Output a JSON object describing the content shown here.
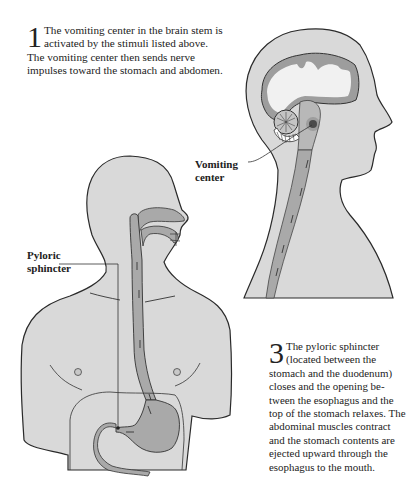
{
  "figure": {
    "steps": [
      {
        "number": "1",
        "text": "The vomiting center in the brain stem is activated by the stimuli listed above. The vomiting center then sends nerve impulses toward the stomach and abdomen."
      },
      {
        "number": "3",
        "text": "The pyloric sphincter (located between the stomach and the duodenum) closes and the opening be-tween the esophagus and the top of the stomach relaxes. The abdominal muscles contract and the stomach contents are ejected upward through the esophagus to the mouth."
      }
    ],
    "labels": {
      "vomiting_center_line1": "Vomiting",
      "vomiting_center_line2": "center",
      "pyloric_line1": "Pyloric",
      "pyloric_line2": "sphincter"
    },
    "colors": {
      "body_fill": "#d9d9d9",
      "organ_fill": "#a9a9a9",
      "brain_white": "#f1f1f1",
      "outline": "#2a2a2a"
    }
  }
}
